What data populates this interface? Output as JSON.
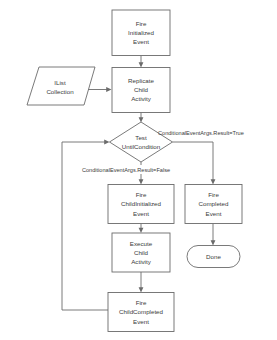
{
  "diagram": {
    "background_color": "#ffffff",
    "stroke_color": "#6b6b6b",
    "text_color": "#3a3a3a"
  },
  "nodes": {
    "fire_initialized": {
      "shape": "rectangle",
      "line1": "Fire",
      "line2": "Initialized",
      "line3": "Event"
    },
    "ilist_collection": {
      "shape": "parallelogram",
      "line1": "IList",
      "line2": "Collection"
    },
    "replicate_child": {
      "shape": "rectangle",
      "line1": "Replicate",
      "line2": "Child",
      "line3": "Activity"
    },
    "test_until_condition": {
      "shape": "diamond",
      "line1": "Test",
      "line2": "UntilCondition"
    },
    "fire_child_initialized": {
      "shape": "rectangle",
      "line1": "Fire",
      "line2": "ChildInitialized",
      "line3": "Event"
    },
    "execute_child": {
      "shape": "rectangle",
      "line1": "Execute",
      "line2": "Child",
      "line3": "Activity"
    },
    "fire_child_completed": {
      "shape": "rectangle",
      "line1": "Fire",
      "line2": "ChildCompleted",
      "line3": "Event"
    },
    "fire_completed": {
      "shape": "rectangle",
      "line1": "Fire",
      "line2": "Completed",
      "line3": "Event"
    },
    "done": {
      "shape": "stadium",
      "line1": "Done"
    }
  },
  "edge_labels": {
    "condition_true": "ConditionalEventArgs.Result=True",
    "condition_false": "ConditionalEventArgs.Result=False"
  }
}
